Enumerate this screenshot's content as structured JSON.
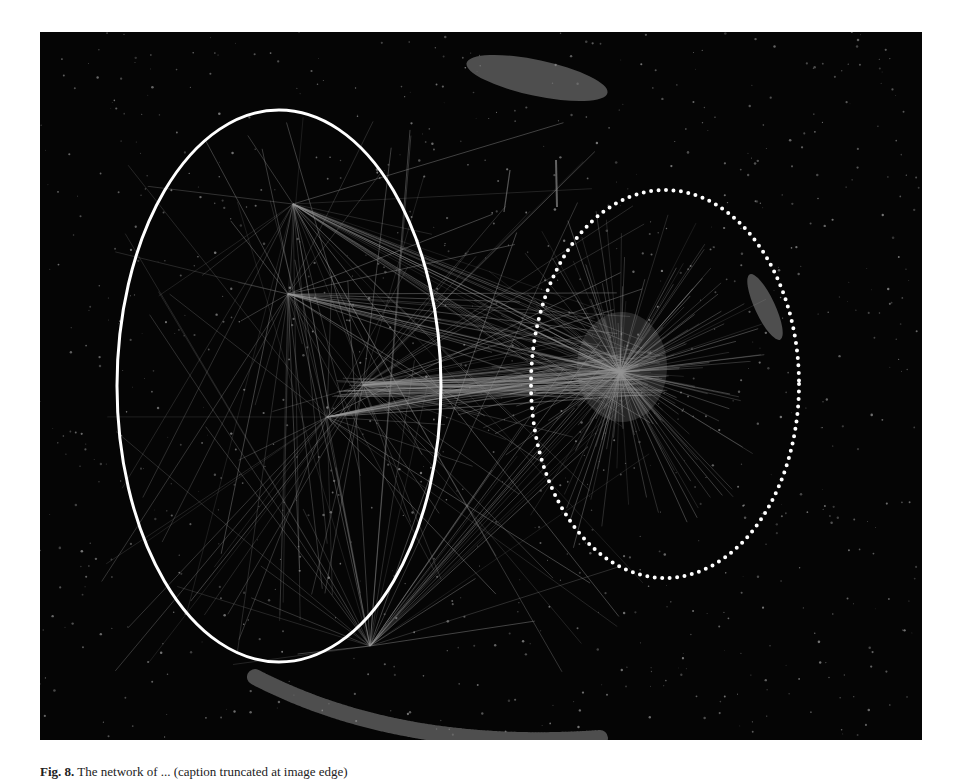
{
  "figure": {
    "type": "network-visualization",
    "background_color": "#050505",
    "node_color": "#8a8a8a",
    "edge_color": "#9a9a9a",
    "annotations": [
      {
        "name": "left-cluster-region",
        "style": "solid",
        "color": "#ffffff",
        "cx": 239,
        "cy": 354,
        "rx": 162,
        "ry": 276
      },
      {
        "name": "right-cluster-region",
        "style": "dotted",
        "color": "#ffffff",
        "cx": 625,
        "cy": 352,
        "rx": 134,
        "ry": 194
      }
    ],
    "hubs": [
      {
        "name": "left-hub-upper",
        "x": 253,
        "y": 172
      },
      {
        "name": "left-hub-mid",
        "x": 248,
        "y": 262
      },
      {
        "name": "left-hub-lower",
        "x": 287,
        "y": 385
      },
      {
        "name": "bridge-hub",
        "x": 323,
        "y": 353
      },
      {
        "name": "bottom-fan-hub",
        "x": 330,
        "y": 614
      },
      {
        "name": "right-dense-core",
        "x": 580,
        "y": 340
      }
    ],
    "peripheral_clusters": [
      {
        "name": "top-blob",
        "cx": 497,
        "cy": 46,
        "rx": 72,
        "ry": 18,
        "rotate": 12
      },
      {
        "name": "bottom-arc",
        "path": "M215 645 Q 360 720 560 706"
      },
      {
        "name": "right-arc-blob",
        "cx": 725,
        "cy": 275,
        "rx": 10,
        "ry": 36,
        "rotate": -25
      }
    ]
  },
  "caption": {
    "label": "Fig. 8.",
    "text": "The network of ... (caption truncated at image edge)"
  }
}
